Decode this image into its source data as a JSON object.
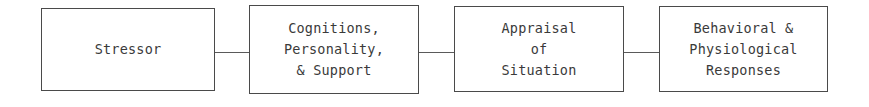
{
  "diagram": {
    "type": "flow-chain",
    "title": "",
    "background_color": "#ffffff",
    "border_color": "#4a4a4a",
    "text_color": "#3a3a3a",
    "connector_color": "#5a5a5a",
    "nodes": [
      {
        "id": "stressor",
        "label": "Stressor",
        "x": 41,
        "y": 8,
        "width": 174,
        "height": 83
      },
      {
        "id": "cognitions-personality-support",
        "label": "Cognitions,\nPersonality,\n& Support",
        "x": 249,
        "y": 5,
        "width": 170,
        "height": 89
      },
      {
        "id": "appraisal-of-situation",
        "label": "Appraisal\nof\nSituation",
        "x": 454,
        "y": 6,
        "width": 170,
        "height": 86
      },
      {
        "id": "behavioral-physiological-responses",
        "label": "Behavioral &\nPhysiological\nResponses",
        "x": 659,
        "y": 6,
        "width": 169,
        "height": 86
      }
    ],
    "connectors": [
      {
        "id": "link-1",
        "from": "stressor",
        "to": "cognitions-personality-support",
        "x": 215,
        "y": 52,
        "length": 34
      },
      {
        "id": "link-2",
        "from": "cognitions-personality-support",
        "to": "appraisal-of-situation",
        "x": 419,
        "y": 52,
        "length": 35
      },
      {
        "id": "link-3",
        "from": "appraisal-of-situation",
        "to": "behavioral-physiological-responses",
        "x": 624,
        "y": 52,
        "length": 35
      }
    ]
  }
}
